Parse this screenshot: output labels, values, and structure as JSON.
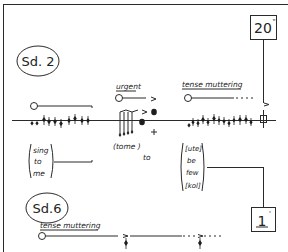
{
  "frame": {
    "ink_color": "#222222",
    "paper_color": "#ffffff"
  },
  "section_top": {
    "label": "Sd. 2",
    "direction_urgent": "urgent",
    "direction_tense": "tense muttering",
    "lyrics_left": [
      "sing",
      "to",
      "me"
    ],
    "lyrics_mid": [
      "(tome )",
      "to"
    ],
    "lyrics_right": [
      "[ute]",
      "be",
      "few",
      "[kol]"
    ],
    "timing_box": {
      "value": "20",
      "unit": "\""
    }
  },
  "section_bottom": {
    "label": "Sd.6",
    "direction_tense": "tense muttering",
    "timing_box": {
      "value": "1",
      "unit": "'"
    }
  }
}
